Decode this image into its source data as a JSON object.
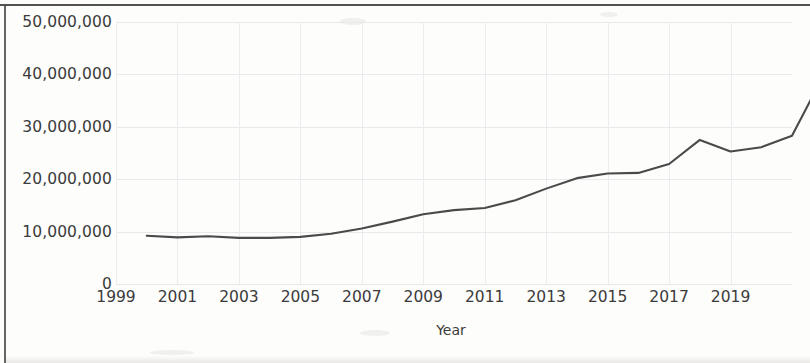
{
  "figure": {
    "type": "line-chart-scan",
    "background_color": "#fdfdfc",
    "line_color": "#4a4a4a"
  },
  "chart_data": {
    "type": "line",
    "title": "",
    "subtitle": "",
    "xlabel": "Year",
    "ylabel": "",
    "grid": true,
    "legend": null,
    "xlim": [
      1999,
      2021
    ],
    "ylim": [
      0,
      50000000
    ],
    "x_tick_labels": [
      "1999",
      "2001",
      "2003",
      "2005",
      "2007",
      "2009",
      "2011",
      "2013",
      "2015",
      "2017",
      "2019"
    ],
    "x_ticks": [
      1999,
      2001,
      2003,
      2005,
      2007,
      2009,
      2011,
      2013,
      2015,
      2017,
      2019
    ],
    "y_tick_labels": [
      "0",
      "10,000,000",
      "20,000,000",
      "30,000,000",
      "40,000,000",
      "50,000,000"
    ],
    "y_ticks": [
      0,
      10000000,
      20000000,
      30000000,
      40000000,
      50000000
    ],
    "x": [
      2000,
      2001,
      2002,
      2003,
      2004,
      2005,
      2006,
      2007,
      2008,
      2009,
      2010,
      2011,
      2012,
      2013,
      2014,
      2015,
      2016,
      2017,
      2018,
      2019,
      2020
    ],
    "values": [
      9200000,
      8900000,
      9100000,
      8800000,
      8800000,
      9000000,
      9600000,
      10600000,
      11900000,
      13300000,
      14100000,
      14500000,
      16000000,
      18200000,
      20200000,
      21100000,
      21200000,
      22900000,
      24600000,
      27500000,
      25300000
    ],
    "series": [
      {
        "name": "Value",
        "points": [
          {
            "x": 2000,
            "y": 9200000
          },
          {
            "x": 2001,
            "y": 8900000
          },
          {
            "x": 2002,
            "y": 9100000
          },
          {
            "x": 2003,
            "y": 8800000
          },
          {
            "x": 2004,
            "y": 8800000
          },
          {
            "x": 2005,
            "y": 9000000
          },
          {
            "x": 2006,
            "y": 9600000
          },
          {
            "x": 2007,
            "y": 10600000
          },
          {
            "x": 2008,
            "y": 11900000
          },
          {
            "x": 2009,
            "y": 13300000
          },
          {
            "x": 2010,
            "y": 14100000
          },
          {
            "x": 2011,
            "y": 14500000
          },
          {
            "x": 2012,
            "y": 16000000
          },
          {
            "x": 2013,
            "y": 18200000
          },
          {
            "x": 2014,
            "y": 20200000
          },
          {
            "x": 2015,
            "y": 21100000
          },
          {
            "x": 2016,
            "y": 21200000
          },
          {
            "x": 2017,
            "y": 22900000
          },
          {
            "x": 2018,
            "y": 27500000
          },
          {
            "x": 2019,
            "y": 25300000
          },
          {
            "x": 2020,
            "y": 26100000
          },
          {
            "x": 2021,
            "y": 28300000
          },
          {
            "x": 2022,
            "y": 39500000
          }
        ]
      }
    ],
    "annotations": []
  }
}
